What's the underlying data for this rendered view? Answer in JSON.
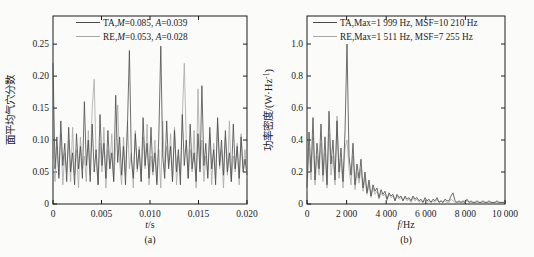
{
  "colors": {
    "ta_line": "#4a4a4a",
    "re_line": "#a8a8a8",
    "axis": "#1c1c1c",
    "text": "#1c1c1c",
    "background": "#fbfbfa"
  },
  "chart_data": [
    {
      "type": "line",
      "panel": "a",
      "caption": "(a)",
      "xlabel_segments": [
        {
          "t": "t",
          "i": true
        },
        {
          "t": "/s"
        }
      ],
      "ylabel_segments": [
        {
          "t": "面平均气穴分数"
        }
      ],
      "xlim": [
        0,
        0.02
      ],
      "ylim": [
        0,
        0.294
      ],
      "grid": false,
      "legend_position": "top-inside",
      "xticks": {
        "values": [
          0,
          0.005,
          0.01,
          0.015,
          0.02
        ],
        "labels": [
          "0",
          "0.005",
          "0.010",
          "0.015",
          "0.020"
        ]
      },
      "yticks": {
        "values": [
          0,
          0.05,
          0.1,
          0.15,
          0.2,
          0.25
        ],
        "labels": [
          "0",
          "0.05",
          "0.10",
          "0.15",
          "0.20",
          "0.25"
        ]
      },
      "series": [
        {
          "name": "TA",
          "color_key": "ta_line",
          "label_segments": [
            {
              "t": "TA,"
            },
            {
              "t": "M",
              "i": true
            },
            {
              "t": "=0.085, "
            },
            {
              "t": "A",
              "i": true
            },
            {
              "t": "=0.039"
            }
          ],
          "values": [
            0.22,
            0.055,
            0.105,
            0.04,
            0.13,
            0.06,
            0.095,
            0.035,
            0.12,
            0.05,
            0.08,
            0.03,
            0.11,
            0.055,
            0.09,
            0.04,
            0.16,
            0.06,
            0.1,
            0.035,
            0.125,
            0.05,
            0.085,
            0.03,
            0.14,
            0.06,
            0.095,
            0.04,
            0.115,
            0.055,
            0.08,
            0.035,
            0.17,
            0.065,
            0.105,
            0.045,
            0.09,
            0.03,
            0.125,
            0.24,
            0.07,
            0.04,
            0.11,
            0.055,
            0.085,
            0.035,
            0.135,
            0.06,
            0.095,
            0.04,
            0.12,
            0.05,
            0.08,
            0.03,
            0.105,
            0.247,
            0.075,
            0.04,
            0.13,
            0.055,
            0.09,
            0.035,
            0.115,
            0.05,
            0.085,
            0.03,
            0.14,
            0.06,
            0.1,
            0.04,
            0.125,
            0.055,
            0.08,
            0.035,
            0.11,
            0.05,
            0.185,
            0.06,
            0.095,
            0.04,
            0.12,
            0.055,
            0.085,
            0.03,
            0.135,
            0.06,
            0.1,
            0.045,
            0.115,
            0.05,
            0.08,
            0.035,
            0.125,
            0.055,
            0.09,
            0.04,
            0.105,
            0.05,
            0.07,
            0.045
          ]
        },
        {
          "name": "RE",
          "color_key": "re_line",
          "label_segments": [
            {
              "t": "RE,"
            },
            {
              "t": "M",
              "i": true
            },
            {
              "t": "=0.053, "
            },
            {
              "t": "A",
              "i": true
            },
            {
              "t": "=0.028"
            }
          ],
          "values": [
            0.07,
            0.035,
            0.09,
            0.045,
            0.11,
            0.03,
            0.08,
            0.05,
            0.1,
            0.035,
            0.12,
            0.045,
            0.085,
            0.025,
            0.105,
            0.055,
            0.075,
            0.035,
            0.115,
            0.045,
            0.15,
            0.195,
            0.07,
            0.03,
            0.095,
            0.05,
            0.12,
            0.025,
            0.085,
            0.055,
            0.11,
            0.035,
            0.09,
            0.155,
            0.065,
            0.03,
            0.105,
            0.045,
            0.13,
            0.055,
            0.08,
            0.025,
            0.115,
            0.05,
            0.09,
            0.035,
            0.105,
            0.055,
            0.125,
            0.03,
            0.075,
            0.045,
            0.1,
            0.035,
            0.085,
            0.025,
            0.13,
            0.05,
            0.09,
            0.06,
            0.11,
            0.035,
            0.12,
            0.03,
            0.075,
            0.045,
            0.135,
            0.22,
            0.095,
            0.04,
            0.085,
            0.05,
            0.115,
            0.025,
            0.18,
            0.055,
            0.1,
            0.035,
            0.075,
            0.045,
            0.11,
            0.03,
            0.095,
            0.04,
            0.125,
            0.055,
            0.085,
            0.025,
            0.105,
            0.045,
            0.13,
            0.035,
            0.075,
            0.05,
            0.095,
            0.03,
            0.11,
            0.055,
            0.085,
            0.04
          ]
        }
      ]
    },
    {
      "type": "line",
      "panel": "b",
      "caption": "(b)",
      "xlabel_segments": [
        {
          "t": "f",
          "i": true
        },
        {
          "t": "/Hz"
        }
      ],
      "ylabel_segments": [
        {
          "t": "功率密度/(W·Hz"
        },
        {
          "t": "-1",
          "sup": true
        },
        {
          "t": ")"
        }
      ],
      "xlim": [
        0,
        10000
      ],
      "ylim": [
        0,
        1.175
      ],
      "grid": false,
      "legend_position": "top-inside",
      "xticks": {
        "values": [
          0,
          2000,
          4000,
          6000,
          8000,
          10000
        ],
        "labels": [
          "0",
          "2 000",
          "4 000",
          "6 000",
          "8 000",
          "10 000"
        ]
      },
      "yticks": {
        "values": [
          0,
          0.2,
          0.4,
          0.6,
          0.8,
          1.0
        ],
        "labels": [
          "0",
          "0.2",
          "0.4",
          "0.6",
          "0.8",
          "1.0"
        ]
      },
      "series": [
        {
          "name": "TA",
          "color_key": "ta_line",
          "label_segments": [
            {
              "t": "TA,Max=1 999 Hz, MSF=10 210 Hz"
            }
          ],
          "values": [
            0.1,
            0.45,
            0.2,
            0.54,
            0.15,
            0.38,
            0.22,
            0.5,
            0.18,
            0.42,
            0.12,
            0.58,
            0.25,
            0.4,
            0.15,
            0.52,
            0.2,
            0.35,
            0.14,
            0.45,
            1.0,
            0.3,
            0.18,
            0.38,
            0.12,
            0.25,
            0.16,
            0.28,
            0.1,
            0.2,
            0.07,
            0.15,
            0.05,
            0.12,
            0.08,
            0.1,
            0.04,
            0.09,
            0.06,
            0.08,
            0.03,
            0.07,
            0.05,
            0.06,
            0.02,
            0.06,
            0.04,
            0.05,
            0.02,
            0.05,
            0.03,
            0.04,
            0.02,
            0.05,
            0.03,
            0.04,
            0.02,
            0.03,
            0.01,
            0.04,
            0.02,
            0.03,
            0.01,
            0.03,
            0.02,
            0.04,
            0.01,
            0.02,
            0.01,
            0.03,
            0.02,
            0.02,
            0.05,
            0.07,
            0.02,
            0.01,
            0.02,
            0.01,
            0.02,
            0.01,
            0.03,
            0.01,
            0.02,
            0.01,
            0.01,
            0.02,
            0.01,
            0.01,
            0.02,
            0.01,
            0.01,
            0.02,
            0.01,
            0.01,
            0.01,
            0.02,
            0.01,
            0.01,
            0.01,
            0.01
          ]
        },
        {
          "name": "RE",
          "color_key": "re_line",
          "label_segments": [
            {
              "t": "RE,Max=1 511 Hz, MSF=7 255 Hz"
            }
          ],
          "values": [
            0.08,
            0.35,
            0.15,
            0.42,
            0.12,
            0.3,
            0.18,
            0.38,
            0.14,
            0.32,
            0.1,
            0.44,
            0.18,
            0.3,
            0.12,
            0.55,
            0.16,
            0.28,
            0.1,
            0.35,
            0.4,
            0.22,
            0.12,
            0.3,
            0.09,
            0.2,
            0.13,
            0.22,
            0.08,
            0.16,
            0.06,
            0.12,
            0.04,
            0.1,
            0.06,
            0.08,
            0.03,
            0.07,
            0.05,
            0.06,
            0.02,
            0.06,
            0.04,
            0.05,
            0.02,
            0.05,
            0.03,
            0.04,
            0.02,
            0.04,
            0.02,
            0.03,
            0.01,
            0.04,
            0.02,
            0.03,
            0.01,
            0.02,
            0.01,
            0.03,
            0.01,
            0.02,
            0.01,
            0.02,
            0.01,
            0.03,
            0.01,
            0.02,
            0.01,
            0.02,
            0.01,
            0.01,
            0.03,
            0.02,
            0.01,
            0.01,
            0.01,
            0.01,
            0.01,
            0.01,
            0.02,
            0.01,
            0.01,
            0.01,
            0.01,
            0.01,
            0.01,
            0.01,
            0.01,
            0.01,
            0.01,
            0.01,
            0.01,
            0.01,
            0.01,
            0.01,
            0.01,
            0.01,
            0.01,
            0.01
          ]
        }
      ]
    }
  ]
}
